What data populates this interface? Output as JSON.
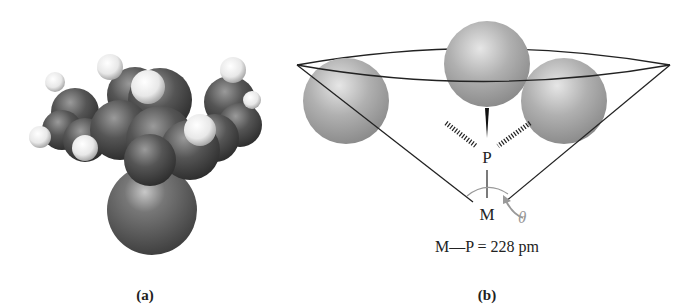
{
  "panels": [
    {
      "id": "a",
      "caption": "(a)",
      "description": "space-filling molecular model"
    },
    {
      "id": "b",
      "caption": "(b)",
      "description": "Tolman cone angle diagram",
      "labels": {
        "phosphorus": "P",
        "metal": "M",
        "angle": "θ",
        "bond_length": "M—P = 228 pm"
      }
    }
  ],
  "colors": {
    "background": "#ffffff",
    "line": "#222222",
    "sphere": "#a0a0a0",
    "angle_label": "#999999"
  }
}
